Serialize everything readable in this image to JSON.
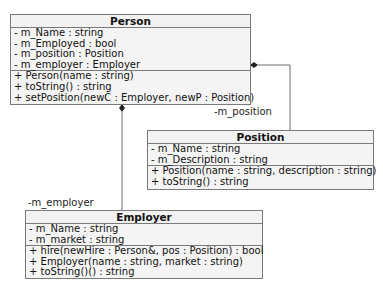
{
  "classes": {
    "person": {
      "name": "Person",
      "attributes": [
        "- m_Name : string",
        "- m_Employed : bool",
        "- m_position : Position",
        "- m_employer : Employer"
      ],
      "operations": [
        "+ Person(name : string)",
        "+ toString() : string",
        "+ setPosition(newC : Employer, newP : Position)"
      ]
    },
    "position": {
      "name": "Position",
      "attributes": [
        "- m_Name : string",
        "- m_Description : string"
      ],
      "operations": [
        "+ Position(name : string, description : string)",
        "+ toString() : string"
      ]
    },
    "employer": {
      "name": "Employer",
      "attributes": [
        "- m_Name : string",
        "- m_market : string"
      ],
      "operations": [
        "+ hire(newHire : Person&, pos : Position) : bool",
        "+ Employer(name : string, market : string)",
        "+ toString()() : string"
      ]
    }
  },
  "associations": {
    "position_role": "-m_position",
    "employer_role": "-m_employer"
  },
  "colors": {
    "box_fill": "#f4f4f4",
    "border": "#7a7a7a",
    "line": "#6e6e6e",
    "diamond": "#222222"
  }
}
